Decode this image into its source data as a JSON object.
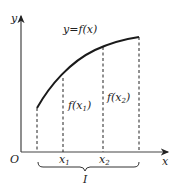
{
  "diagram": {
    "axes": {
      "y_label": "y",
      "x_label": "x",
      "origin_label": "O",
      "color": "#333333"
    },
    "curve": {
      "label_prefix": "y=f(x)",
      "color": "#1a1a1a"
    },
    "points": [
      {
        "name": "x1",
        "label": "x",
        "sub": "1"
      },
      {
        "name": "x2",
        "label": "x",
        "sub": "2"
      }
    ],
    "function_values": [
      {
        "label": "f(x",
        "sub": "1",
        "suffix": ")"
      },
      {
        "label": "f(x",
        "sub": "2",
        "suffix": ")"
      }
    ],
    "interval_label": "I"
  }
}
